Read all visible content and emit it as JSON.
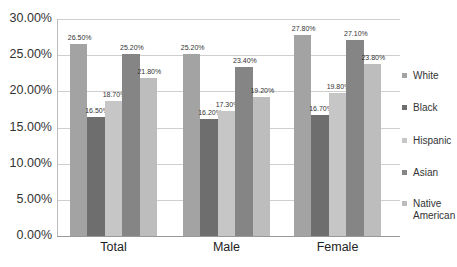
{
  "chart_data": {
    "type": "bar",
    "title": "",
    "xlabel": "",
    "ylabel": "",
    "ylim": [
      0,
      30
    ],
    "y_ticks": [
      "0.00%",
      "5.00%",
      "10.00%",
      "15.00%",
      "20.00%",
      "25.00%",
      "30.00%"
    ],
    "grid": true,
    "legend_position": "right",
    "categories": [
      "Total",
      "Male",
      "Female"
    ],
    "series": [
      {
        "name": "White",
        "color": "#a3a3a3",
        "values": [
          26.5,
          25.2,
          27.8
        ],
        "labels": [
          "26.50%",
          "25.20%",
          "27.80%"
        ]
      },
      {
        "name": "Black",
        "color": "#6e6e6e",
        "values": [
          16.5,
          16.2,
          16.7
        ],
        "labels": [
          "16.50%",
          "16.20%",
          "16.70%"
        ]
      },
      {
        "name": "Hispanic",
        "color": "#c6c6c6",
        "values": [
          18.7,
          17.3,
          19.8
        ],
        "labels": [
          "18.70%",
          "17.30%",
          "19.80%"
        ]
      },
      {
        "name": "Asian",
        "color": "#858585",
        "values": [
          25.2,
          23.4,
          27.1
        ],
        "labels": [
          "25.20%",
          "23.40%",
          "27.10%"
        ]
      },
      {
        "name": "Native American",
        "color": "#bdbdbd",
        "values": [
          21.8,
          19.2,
          23.8
        ],
        "labels": [
          "21.80%",
          "19.20%",
          "23.80%"
        ]
      }
    ]
  },
  "legend": {
    "items": [
      {
        "label": "White"
      },
      {
        "label": "Black"
      },
      {
        "label": "Hispanic"
      },
      {
        "label": "Asian"
      },
      {
        "label": "Native\nAmerican"
      }
    ]
  }
}
